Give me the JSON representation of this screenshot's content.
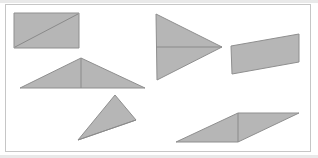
{
  "figure": {
    "title": "",
    "caption": "",
    "background_color": "#ffffff",
    "frame": {
      "name": "figure-border",
      "x": 5.5,
      "y": 4.5,
      "width": 305,
      "height": 147,
      "stroke_color": "#c6c6c6",
      "stroke_width": 1
    },
    "style": {
      "shape_fill_color": "#b6b6b6",
      "shape_stroke_color": "#8f8f8f",
      "shape_stroke_width": 1,
      "crease_line_color": "#8a8a8a",
      "crease_line_width": 1
    },
    "shape_count": 6,
    "shapes": [
      {
        "id": "shape-1",
        "name": "rectangle-with-diagonal-crease",
        "kind": "rectangle",
        "label": "Rectangle",
        "points": "14,13 79,13 79,48 14,48",
        "crease": {
          "x1": 15,
          "y1": 47,
          "x2": 78,
          "y2": 14
        }
      },
      {
        "id": "shape-2",
        "name": "wide-isoceles-triangle-with-vertical-crease",
        "kind": "triangle",
        "label": "Wide triangle",
        "points": "81,58 145,88 20,88",
        "crease": {
          "x1": 81,
          "y1": 58,
          "x2": 81,
          "y2": 88
        }
      },
      {
        "id": "shape-3",
        "name": "right-pointing-triangle-with-horizontal-crease",
        "kind": "triangle",
        "label": "Right-pointing triangle",
        "points": "156,14 222,47 157,80",
        "crease": {
          "x1": 156,
          "y1": 47,
          "x2": 222,
          "y2": 47
        }
      },
      {
        "id": "shape-4",
        "name": "slanted-parallelogram-with-horizontal-crease",
        "kind": "parallelogram",
        "label": "Slanted parallelogram",
        "points": "299,34 299,62 232,74 231,46"
      },
      {
        "id": "shape-5",
        "name": "apex-triangle-with-diagonal-crease",
        "kind": "triangle",
        "label": "Apex triangle",
        "points": "115,95 136,120 78,140",
        "crease": {
          "x1": 78,
          "y1": 140,
          "x2": 136,
          "y2": 120
        }
      },
      {
        "id": "shape-6",
        "name": "flat-parallelogram-with-vertical-crease",
        "kind": "parallelogram",
        "label": "Flat parallelogram",
        "points": "238,113 299,113 238,142 176,142",
        "crease": {
          "x1": 238,
          "y1": 113,
          "x2": 238,
          "y2": 142
        }
      }
    ],
    "specks": [
      {
        "name": "edge-speck-top-left",
        "x": 0,
        "y": 0,
        "width": 318,
        "height": 3
      },
      {
        "name": "edge-speck-bottom",
        "x": 0,
        "y": 155,
        "width": 318,
        "height": 3
      }
    ]
  }
}
